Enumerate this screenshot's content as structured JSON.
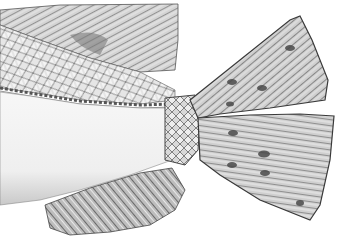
{
  "image": {
    "subject": "Pencil illustration of a fish tail section",
    "style": "grayscale engraving / pencil drawing",
    "background": "#ffffff",
    "ink_dark": "#3a3a3a",
    "ink_mid": "#8a8a8a",
    "ink_light": "#c8c8c8",
    "elements": [
      {
        "name": "dorsal-fin",
        "description": "striated rays upper-left"
      },
      {
        "name": "body-scales",
        "description": "diamond scale pattern on upper body"
      },
      {
        "name": "lateral-line",
        "description": "rope-like line running horizontally"
      },
      {
        "name": "belly",
        "description": "pale smooth lower body"
      },
      {
        "name": "caudal-peduncle",
        "description": "netted scales at tail base"
      },
      {
        "name": "caudal-fin-upper-lobe",
        "description": "forked upper tail lobe with spots"
      },
      {
        "name": "caudal-fin-lower-lobe",
        "description": "lower tail lobe with dark spots"
      },
      {
        "name": "anal-fin",
        "description": "striated rays lower-left"
      }
    ]
  }
}
